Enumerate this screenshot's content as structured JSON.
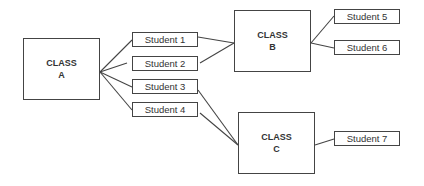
{
  "classes": [
    {
      "id": "A",
      "line1": "CLASS",
      "line2": "A"
    },
    {
      "id": "B",
      "line1": "CLASS",
      "line2": "B"
    },
    {
      "id": "C",
      "line1": "CLASS",
      "line2": "C"
    }
  ],
  "students": [
    {
      "label": "Student 1"
    },
    {
      "label": "Student 2"
    },
    {
      "label": "Student 3"
    },
    {
      "label": "Student 4"
    },
    {
      "label": "Student 5"
    },
    {
      "label": "Student 6"
    },
    {
      "label": "Student 7"
    }
  ],
  "edges": [
    {
      "from": "Class A",
      "to": "Student 1"
    },
    {
      "from": "Class A",
      "to": "Student 2"
    },
    {
      "from": "Class A",
      "to": "Student 3"
    },
    {
      "from": "Class A",
      "to": "Student 4"
    },
    {
      "from": "Student 1",
      "to": "Class B"
    },
    {
      "from": "Student 2",
      "to": "Class B"
    },
    {
      "from": "Student 3",
      "to": "Class C"
    },
    {
      "from": "Student 4",
      "to": "Class C"
    },
    {
      "from": "Class B",
      "to": "Student 5"
    },
    {
      "from": "Class B",
      "to": "Student 6"
    },
    {
      "from": "Class C",
      "to": "Student 7"
    }
  ]
}
